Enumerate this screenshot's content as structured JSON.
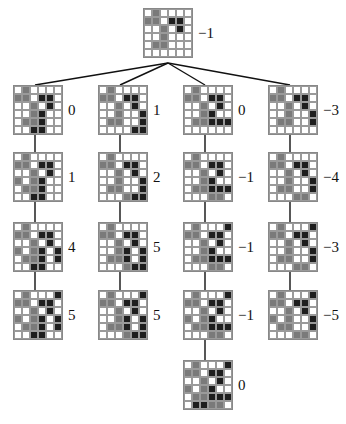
{
  "diagram": {
    "type": "search-tree",
    "grid_size": 6,
    "cell_legend": {
      "0": "empty",
      "1": "gray-stone",
      "2": "black-stone"
    },
    "colors": {
      "empty": "#ffffff",
      "gray": "#7a7a7a",
      "black": "#1e1e1e",
      "grid": "#9a9a9a",
      "line": "#111111"
    },
    "root": {
      "value": "−1",
      "x": 143,
      "y": 8,
      "grid": [
        [
          0,
          1,
          0,
          0,
          0,
          0
        ],
        [
          1,
          1,
          0,
          2,
          2,
          0
        ],
        [
          0,
          0,
          1,
          0,
          2,
          0
        ],
        [
          0,
          0,
          1,
          0,
          0,
          0
        ],
        [
          0,
          1,
          1,
          0,
          0,
          0
        ],
        [
          0,
          0,
          0,
          0,
          0,
          0
        ]
      ]
    },
    "branches": [
      {
        "x": 13,
        "nodes": [
          {
            "value": "0",
            "y": 85,
            "grid": [
              [
                0,
                1,
                0,
                0,
                0,
                0
              ],
              [
                1,
                1,
                0,
                2,
                2,
                0
              ],
              [
                0,
                0,
                1,
                0,
                2,
                0
              ],
              [
                0,
                0,
                1,
                2,
                0,
                0
              ],
              [
                0,
                1,
                1,
                2,
                0,
                0
              ],
              [
                0,
                0,
                2,
                2,
                0,
                0
              ]
            ]
          },
          {
            "value": "1",
            "y": 152,
            "grid": [
              [
                0,
                1,
                0,
                0,
                0,
                0
              ],
              [
                1,
                1,
                0,
                2,
                2,
                0
              ],
              [
                0,
                0,
                1,
                0,
                2,
                0
              ],
              [
                1,
                0,
                1,
                2,
                0,
                0
              ],
              [
                0,
                1,
                1,
                2,
                0,
                0
              ],
              [
                0,
                0,
                2,
                2,
                0,
                0
              ]
            ]
          },
          {
            "value": "4",
            "y": 222,
            "grid": [
              [
                0,
                1,
                0,
                0,
                0,
                0
              ],
              [
                1,
                1,
                0,
                2,
                2,
                0
              ],
              [
                0,
                0,
                1,
                0,
                2,
                0
              ],
              [
                1,
                0,
                1,
                2,
                0,
                2
              ],
              [
                0,
                1,
                1,
                2,
                0,
                2
              ],
              [
                0,
                0,
                2,
                2,
                0,
                0
              ]
            ]
          },
          {
            "value": "5",
            "y": 290,
            "grid": [
              [
                0,
                1,
                0,
                0,
                0,
                2
              ],
              [
                1,
                1,
                0,
                2,
                2,
                0
              ],
              [
                0,
                0,
                1,
                0,
                2,
                0
              ],
              [
                1,
                0,
                1,
                2,
                0,
                2
              ],
              [
                0,
                1,
                1,
                2,
                0,
                2
              ],
              [
                0,
                0,
                2,
                2,
                0,
                0
              ]
            ]
          }
        ]
      },
      {
        "x": 98,
        "nodes": [
          {
            "value": "1",
            "y": 85,
            "grid": [
              [
                0,
                1,
                0,
                0,
                0,
                0
              ],
              [
                1,
                1,
                0,
                2,
                2,
                0
              ],
              [
                0,
                0,
                1,
                0,
                2,
                0
              ],
              [
                0,
                0,
                1,
                0,
                0,
                2
              ],
              [
                0,
                1,
                1,
                0,
                0,
                2
              ],
              [
                0,
                0,
                0,
                0,
                2,
                2
              ]
            ]
          },
          {
            "value": "2",
            "y": 152,
            "grid": [
              [
                0,
                1,
                0,
                0,
                0,
                0
              ],
              [
                1,
                1,
                0,
                2,
                2,
                0
              ],
              [
                0,
                0,
                1,
                0,
                2,
                0
              ],
              [
                0,
                0,
                1,
                0,
                0,
                2
              ],
              [
                0,
                1,
                1,
                0,
                0,
                2
              ],
              [
                0,
                0,
                0,
                1,
                2,
                2
              ]
            ]
          },
          {
            "value": "5",
            "y": 222,
            "grid": [
              [
                0,
                1,
                0,
                0,
                0,
                0
              ],
              [
                1,
                1,
                0,
                2,
                2,
                0
              ],
              [
                0,
                0,
                1,
                0,
                2,
                0
              ],
              [
                0,
                0,
                1,
                2,
                0,
                2
              ],
              [
                0,
                1,
                1,
                2,
                0,
                2
              ],
              [
                0,
                0,
                0,
                1,
                2,
                2
              ]
            ]
          },
          {
            "value": "5",
            "y": 290,
            "grid": [
              [
                0,
                1,
                0,
                0,
                0,
                2
              ],
              [
                1,
                1,
                0,
                2,
                2,
                0
              ],
              [
                0,
                0,
                1,
                0,
                2,
                0
              ],
              [
                0,
                0,
                1,
                2,
                0,
                2
              ],
              [
                0,
                1,
                1,
                2,
                0,
                2
              ],
              [
                0,
                0,
                0,
                1,
                2,
                2
              ]
            ]
          }
        ]
      },
      {
        "x": 183,
        "nodes": [
          {
            "value": "0",
            "y": 85,
            "grid": [
              [
                0,
                1,
                0,
                0,
                0,
                0
              ],
              [
                1,
                1,
                0,
                2,
                2,
                0
              ],
              [
                0,
                0,
                1,
                0,
                2,
                0
              ],
              [
                0,
                0,
                1,
                2,
                0,
                0
              ],
              [
                0,
                1,
                1,
                2,
                2,
                2
              ],
              [
                0,
                0,
                0,
                0,
                0,
                0
              ]
            ]
          },
          {
            "value": "−1",
            "y": 152,
            "grid": [
              [
                0,
                1,
                0,
                0,
                0,
                0
              ],
              [
                1,
                1,
                0,
                2,
                2,
                0
              ],
              [
                0,
                0,
                1,
                0,
                2,
                0
              ],
              [
                0,
                0,
                1,
                2,
                0,
                0
              ],
              [
                0,
                1,
                1,
                2,
                2,
                2
              ],
              [
                0,
                0,
                0,
                1,
                1,
                0
              ]
            ]
          },
          {
            "value": "−1",
            "y": 222,
            "grid": [
              [
                0,
                1,
                0,
                0,
                0,
                2
              ],
              [
                1,
                1,
                0,
                2,
                2,
                0
              ],
              [
                0,
                0,
                1,
                0,
                2,
                0
              ],
              [
                0,
                0,
                1,
                2,
                0,
                0
              ],
              [
                0,
                1,
                1,
                2,
                2,
                2
              ],
              [
                0,
                0,
                0,
                1,
                1,
                0
              ]
            ]
          },
          {
            "value": "−1",
            "y": 290,
            "grid": [
              [
                0,
                1,
                0,
                0,
                0,
                2
              ],
              [
                1,
                1,
                0,
                2,
                2,
                0
              ],
              [
                0,
                0,
                1,
                0,
                2,
                0
              ],
              [
                1,
                0,
                1,
                2,
                0,
                0
              ],
              [
                0,
                1,
                1,
                2,
                2,
                2
              ],
              [
                0,
                0,
                0,
                1,
                1,
                0
              ]
            ]
          },
          {
            "value": "0",
            "y": 360,
            "grid": [
              [
                0,
                1,
                0,
                0,
                0,
                2
              ],
              [
                1,
                1,
                0,
                2,
                2,
                0
              ],
              [
                0,
                0,
                1,
                0,
                2,
                0
              ],
              [
                1,
                0,
                1,
                2,
                0,
                0
              ],
              [
                0,
                1,
                1,
                2,
                2,
                2
              ],
              [
                0,
                2,
                2,
                1,
                1,
                0
              ]
            ]
          }
        ]
      },
      {
        "x": 268,
        "nodes": [
          {
            "value": "−3",
            "y": 85,
            "grid": [
              [
                0,
                1,
                0,
                0,
                0,
                0
              ],
              [
                1,
                1,
                0,
                2,
                2,
                0
              ],
              [
                0,
                0,
                1,
                0,
                2,
                0
              ],
              [
                0,
                0,
                1,
                0,
                0,
                2
              ],
              [
                0,
                1,
                1,
                0,
                0,
                2
              ],
              [
                0,
                0,
                0,
                0,
                0,
                0
              ]
            ]
          },
          {
            "value": "−4",
            "y": 152,
            "grid": [
              [
                0,
                1,
                0,
                0,
                0,
                0
              ],
              [
                1,
                1,
                0,
                2,
                2,
                0
              ],
              [
                0,
                0,
                1,
                0,
                2,
                0
              ],
              [
                0,
                0,
                1,
                0,
                0,
                2
              ],
              [
                0,
                1,
                1,
                0,
                0,
                2
              ],
              [
                0,
                0,
                0,
                1,
                1,
                0
              ]
            ]
          },
          {
            "value": "−3",
            "y": 222,
            "grid": [
              [
                0,
                1,
                0,
                0,
                0,
                2
              ],
              [
                1,
                1,
                0,
                2,
                2,
                0
              ],
              [
                0,
                0,
                1,
                0,
                2,
                0
              ],
              [
                0,
                0,
                1,
                0,
                0,
                2
              ],
              [
                0,
                1,
                1,
                0,
                0,
                2
              ],
              [
                0,
                0,
                0,
                1,
                1,
                0
              ]
            ]
          },
          {
            "value": "−5",
            "y": 290,
            "grid": [
              [
                0,
                1,
                0,
                0,
                0,
                2
              ],
              [
                1,
                1,
                0,
                2,
                2,
                0
              ],
              [
                0,
                0,
                1,
                0,
                2,
                0
              ],
              [
                1,
                0,
                1,
                0,
                0,
                2
              ],
              [
                0,
                1,
                1,
                0,
                0,
                2
              ],
              [
                0,
                0,
                0,
                1,
                1,
                0
              ]
            ]
          }
        ]
      }
    ]
  }
}
